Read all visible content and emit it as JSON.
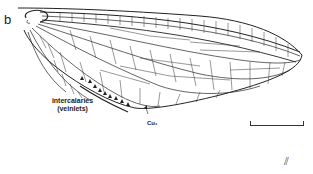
{
  "figure": {
    "panel_label": "b",
    "annotations": {
      "intercalaries": "intercalaries",
      "veinlets": "(veinlets)",
      "cu": "Cu₁"
    },
    "scale_bar": "scale-bar",
    "corner_mark": "⫽",
    "colors": {
      "ink": "#222222",
      "background": "#ffffff"
    }
  }
}
